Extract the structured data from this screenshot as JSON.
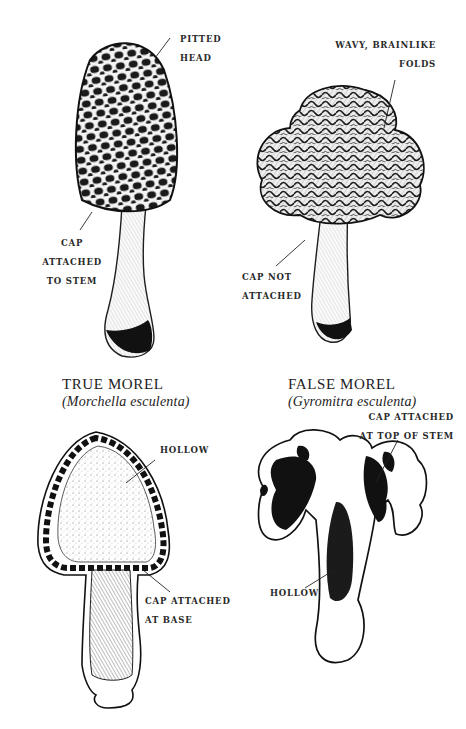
{
  "figure": {
    "true_morel": {
      "title": "TRUE MOREL",
      "scientific_name": "(Morchella esculenta)",
      "exterior_labels": {
        "pitted_head": [
          "PITTED",
          "HEAD"
        ],
        "cap_attached": [
          "CAP",
          "ATTACHED",
          "TO STEM"
        ]
      },
      "cross_section_labels": {
        "hollow": [
          "HOLLOW"
        ],
        "cap_attached_base": [
          "CAP ATTACHED",
          "AT BASE"
        ]
      }
    },
    "false_morel": {
      "title": "FALSE MOREL",
      "scientific_name": "(Gyromitra esculenta)",
      "exterior_labels": {
        "brainlike_folds": [
          "WAVY, BRAINLIKE",
          "FOLDS"
        ],
        "cap_not_attached": [
          "CAP NOT",
          "ATTACHED"
        ]
      },
      "cross_section_labels": {
        "cap_attached_top": [
          "CAP ATTACHED",
          "AT TOP OF STEM"
        ],
        "hollow": [
          "HOLLOW"
        ]
      }
    },
    "colors": {
      "ink": "#1e1e1e",
      "paper": "#ffffff"
    }
  }
}
